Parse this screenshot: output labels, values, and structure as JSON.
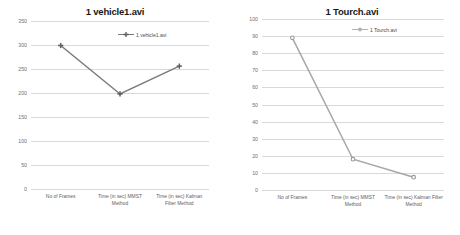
{
  "chart_data": [
    {
      "type": "line",
      "title": "1 vehicle1.avi",
      "xlabel": "",
      "ylabel": "",
      "categories": [
        "No of Frames",
        "Time (in sec) MMST Method",
        "Time (in sec) Kalman Filter Method"
      ],
      "series": [
        {
          "name": "1 vehicle1.avi",
          "values": [
            299,
            198,
            256
          ]
        }
      ],
      "legend": [
        "1 vehicle1.avi"
      ],
      "legend_position": "top-right",
      "ylim": [
        0,
        350
      ],
      "yticks": [
        0,
        50,
        100,
        150,
        200,
        250,
        300,
        350
      ],
      "ytick_labels": [
        "0",
        "50",
        "100",
        "150",
        "200",
        "250",
        "300",
        "350"
      ],
      "grid": true,
      "series_color": "#7a7a7a",
      "marker": "plus"
    },
    {
      "type": "line",
      "title": "1 Tourch.avi",
      "xlabel": "",
      "ylabel": "",
      "categories": [
        "No of Frames",
        "Time (in sec) MMST Method",
        "Time (in sec) Kalman Filter Method"
      ],
      "series": [
        {
          "name": "1 Tourch.avi",
          "values": [
            89,
            18,
            7.5
          ]
        }
      ],
      "legend": [
        "1 Tourch.avi"
      ],
      "legend_position": "top-right",
      "ylim": [
        0,
        100
      ],
      "yticks": [
        0,
        10,
        20,
        30,
        40,
        50,
        60,
        70,
        80,
        90,
        100
      ],
      "ytick_labels": [
        "0",
        "10",
        "20",
        "30",
        "40",
        "50",
        "60",
        "70",
        "80",
        "90",
        "100"
      ],
      "grid": true,
      "series_color": "#a6a6a6",
      "marker": "circle"
    }
  ],
  "colors": {
    "background": "#ffffff",
    "gridline": "#d9d9d9",
    "tick_text": "#6f6f6f",
    "title_text": "#1a1a1a",
    "series_left": "#7a7a7a",
    "series_right": "#a6a6a6"
  },
  "left_chart": {
    "title": "1 vehicle1.avi",
    "legend_label": "1 vehicle1.avi",
    "ytick_labels": [
      "350",
      "300",
      "250",
      "200",
      "150",
      "100",
      "50",
      "0"
    ],
    "xtick_labels": [
      "No of Frames",
      "Time (in sec) MMST Method",
      "Time (in sec) Kalman Filter Method"
    ]
  },
  "right_chart": {
    "title": "1 Tourch.avi",
    "legend_label": "1 Tourch.avi",
    "ytick_labels": [
      "100",
      "90",
      "80",
      "70",
      "60",
      "50",
      "40",
      "30",
      "20",
      "10",
      "0"
    ],
    "xtick_labels": [
      "No of Frames",
      "Time (in sec) MMST Method",
      "Time (in sec) Kalman Filter Method"
    ]
  }
}
